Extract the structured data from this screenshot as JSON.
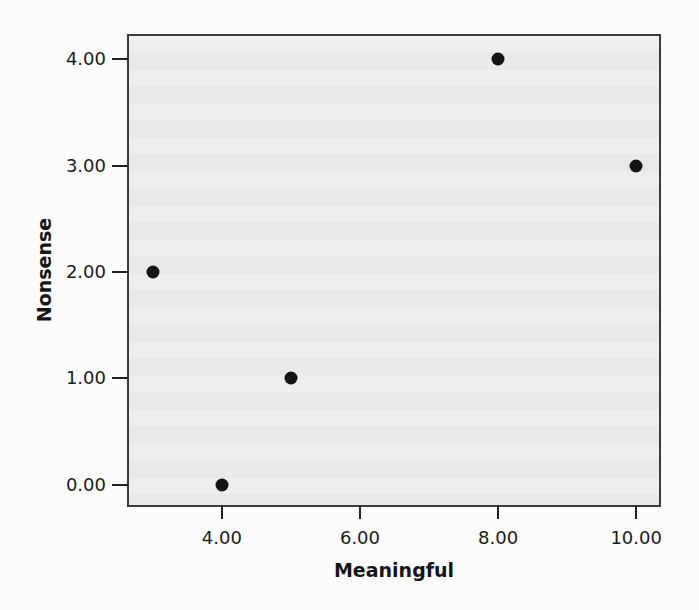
{
  "chart_data": {
    "type": "scatter",
    "title": "",
    "xlabel": "Meaningful",
    "ylabel": "Nonsense",
    "points": [
      {
        "x": 3,
        "y": 2
      },
      {
        "x": 4,
        "y": 0
      },
      {
        "x": 5,
        "y": 1
      },
      {
        "x": 8,
        "y": 4
      },
      {
        "x": 10,
        "y": 3
      }
    ],
    "x_ticks": [
      {
        "value": 4,
        "label": "4.00"
      },
      {
        "value": 6,
        "label": "6.00"
      },
      {
        "value": 8,
        "label": "8.00"
      },
      {
        "value": 10,
        "label": "10.00"
      }
    ],
    "y_ticks": [
      {
        "value": 0,
        "label": "0.00"
      },
      {
        "value": 1,
        "label": "1.00"
      },
      {
        "value": 2,
        "label": "2.00"
      },
      {
        "value": 3,
        "label": "3.00"
      },
      {
        "value": 4,
        "label": "4.00"
      }
    ],
    "xlim": [
      2.64,
      10.36
    ],
    "ylim": [
      -0.19,
      4.23
    ],
    "grid": false,
    "legend": false,
    "marker": {
      "shape": "circle",
      "color": "#141414",
      "diameter_px": 13
    },
    "colors": {
      "plot_background": "#ebebeb",
      "plot_border": "#3b3b3b",
      "tick": "#222222",
      "text": "#1b1b1b",
      "page_background": "#fcfcfc"
    }
  }
}
